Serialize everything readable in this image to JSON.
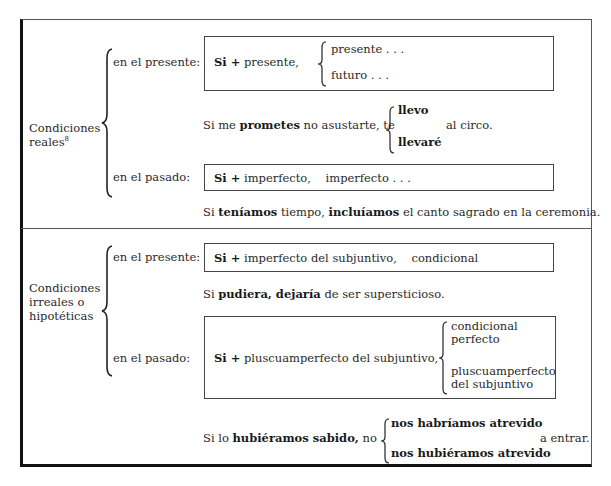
{
  "real": {
    "category_line1": "Condiciones",
    "category_line2": "reales",
    "footnote": "8",
    "present_label": "en el presente:",
    "present_formula_si": "Si +",
    "present_formula_rest": "presente,",
    "present_options": [
      "presente . . .",
      "futuro . . ."
    ],
    "example1_pre": "Si me",
    "example1_bold": "prometes",
    "example1_mid": "no asustarte, te",
    "example1_options": [
      "llevo",
      "llevaré"
    ],
    "example1_post": "al circo.",
    "past_label": "en el pasado:",
    "past_formula_si": "Si +",
    "past_formula_rest": "imperfecto,    imperfecto . . .",
    "example2_pre": "Si",
    "example2_bold1": "teníamos",
    "example2_mid": "tiempo,",
    "example2_bold2": "incluíamos",
    "example2_post": "el canto sagrado en la ceremonia."
  },
  "unreal": {
    "category_line1": "Condiciones",
    "category_line2": "irreales o",
    "category_line3": "hipotéticas",
    "present_label": "en el presente:",
    "present_formula_si": "Si +",
    "present_formula_rest": "imperfecto del subjuntivo,    condicional",
    "example1_pre": "Si",
    "example1_bold": "pudiera, dejaría",
    "example1_post": "de ser supersticioso.",
    "past_label": "en el pasado:",
    "past_formula_si": "Si +",
    "past_formula_rest": "pluscuamperfecto del subjuntivo,",
    "past_options": [
      [
        "condicional",
        "perfecto"
      ],
      [
        "pluscuamperfecto",
        "del subjuntivo"
      ]
    ],
    "example2_pre": "Si lo",
    "example2_bold": "hubiéramos sabido,",
    "example2_mid": "no",
    "example2_options": [
      "nos habríamos atrevido",
      "nos hubiéramos atrevido"
    ],
    "example2_post": "a entrar."
  }
}
